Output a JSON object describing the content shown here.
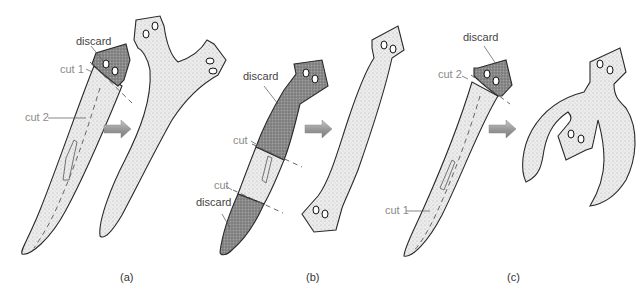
{
  "figure": {
    "colors": {
      "body_fill": "#e4e4e4",
      "discard_fill": "#7d7d7d",
      "outline": "#2a2a2a",
      "cut_line": "#666666",
      "arrow": "#9a9a9a",
      "label_gray": "#8a8a8a",
      "label_dark": "#444444"
    },
    "panels": [
      {
        "id": "a",
        "label": "(a)",
        "annotations": {
          "discard": "discard",
          "cut1": "cut 1",
          "cut2": "cut 2"
        },
        "result": "two-headed worm (head split lengthwise forms Y-shape)"
      },
      {
        "id": "b",
        "label": "(b)",
        "annotations": {
          "discard_top": "discard",
          "cut_upper": "cut",
          "cut_lower": "cut",
          "discard_bottom": "discard"
        },
        "result": "worm with heads at both ends"
      },
      {
        "id": "c",
        "label": "(c)",
        "annotations": {
          "discard": "discard",
          "cut1": "cut 1",
          "cut2": "cut 2"
        },
        "result": "worm with a head regenerated at the cut middle, tails curving"
      }
    ]
  }
}
